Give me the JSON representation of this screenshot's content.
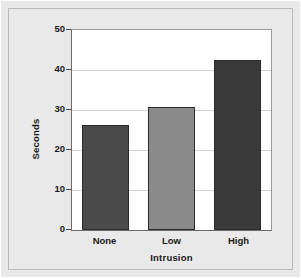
{
  "chart_data": {
    "type": "bar",
    "title": "",
    "categories": [
      "None",
      "Low",
      "High"
    ],
    "values": [
      26.3,
      30.8,
      42.5
    ],
    "series": [
      {
        "name": "Seconds",
        "values": [
          26.3,
          30.8,
          42.5
        ]
      }
    ],
    "xlabel": "Intrusion",
    "ylabel": "Seconds",
    "ylim": [
      0,
      50
    ],
    "yticks": [
      0,
      10,
      20,
      30,
      40,
      50
    ],
    "ytick_labels": [
      "0",
      "10",
      "20",
      "30",
      "40",
      "50"
    ],
    "grid": true,
    "gridlines_at": [
      10,
      20,
      30,
      40
    ],
    "legend": null,
    "legend_position": "none",
    "bar_colors": [
      "#4a4a4a",
      "#8a8a8a",
      "#3a3a3a"
    ],
    "bar_edge_color": "#2b2b2b",
    "plot_background": "#ffffff",
    "figure_background": "#e9e9e9",
    "gridline_color": "#d2d2d2",
    "axis_color": "#6a6a6a",
    "text_color": "#1a1a1a"
  }
}
